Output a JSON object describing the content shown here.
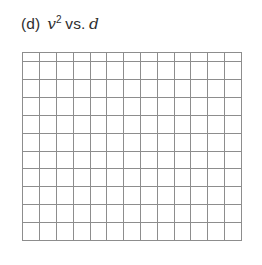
{
  "figure": {
    "label": "(d)",
    "y_variable": "v",
    "y_exponent": "2",
    "relation": "vs.",
    "x_variable": "d",
    "caption_full": "(d) v2 vs. d",
    "background_color": "#ffffff",
    "text_color": "#2e2e2e"
  },
  "chart_data": {
    "type": "grid",
    "subtitle": "",
    "xlabel": "d",
    "ylabel": "v2",
    "series": [],
    "x": [],
    "values": [],
    "categories": [],
    "annotations": [],
    "legend": [],
    "legend_position": "none",
    "grid": true,
    "grid_columns": 13,
    "grid_rows": 11,
    "grid_line_color": "#8d8d8d",
    "grid_fill_color": "#ffffff",
    "axis_tick_labels_x": [],
    "axis_tick_labels_y": [],
    "xlim": [],
    "ylim": [],
    "note": "Blank graph paper grid provided for the student to plot v squared versus d; no data points are drawn."
  }
}
